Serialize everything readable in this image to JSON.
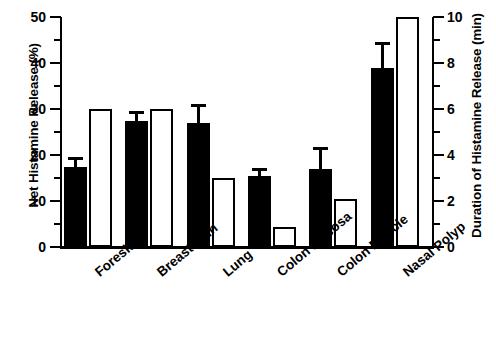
{
  "chart_data": {
    "type": "bar",
    "title": "",
    "categories": [
      "Foreskin",
      "Breast Skin",
      "Lung",
      "Colon Mucosa",
      "Colon Muscle",
      "Nasal Polyp"
    ],
    "series": [
      {
        "name": "Net Histamine Release (%)",
        "style": "filled-black",
        "axis": "left",
        "values": [
          17.5,
          27.5,
          27.0,
          15.5,
          17.0,
          39.0
        ],
        "errors": [
          1.5,
          1.5,
          3.5,
          1.0,
          4.0,
          5.0
        ]
      },
      {
        "name": "Duration of Histamine Release (min)",
        "style": "open-white",
        "axis": "right",
        "values": [
          6.0,
          6.0,
          3.0,
          0.85,
          2.1,
          10.0
        ],
        "errors": [
          0,
          0,
          0,
          0,
          0,
          0
        ]
      }
    ],
    "xlabel": "",
    "ylabel": "Net Histamine Release (%)",
    "ylabel_right": "Duration of Histamine Release (min)",
    "ylim": [
      0,
      50
    ],
    "ylim_right": [
      0,
      10
    ],
    "yticks": [
      0,
      10,
      20,
      30,
      40,
      50
    ],
    "yticks_minor": [
      5,
      15,
      25,
      35,
      45
    ],
    "yticks_right": [
      0,
      2,
      4,
      6,
      8,
      10
    ],
    "yticks_minor_right": [
      1,
      3,
      5,
      7,
      9
    ],
    "ytick_labels": [
      "0",
      "10",
      "20",
      "30",
      "40",
      "50"
    ],
    "ytick_labels_right": [
      "0",
      "2",
      "4",
      "6",
      "8",
      "10"
    ],
    "grid": false,
    "legend": "none"
  }
}
